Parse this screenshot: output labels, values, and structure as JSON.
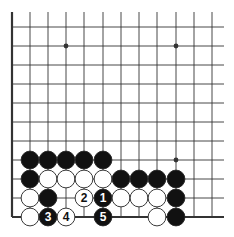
{
  "diagram": {
    "type": "go-board-fragment",
    "grid": {
      "x_lines": [
        12,
        30,
        48,
        66,
        84,
        103,
        121,
        139,
        157,
        176,
        194,
        212
      ],
      "y_lines": [
        27,
        46,
        65,
        84,
        103,
        122,
        141,
        160,
        179,
        198,
        217
      ],
      "right_extent": 224,
      "top_extent": 12,
      "left_edge": true,
      "bottom_edge": true
    },
    "star_points": [
      {
        "col": 3,
        "row": 1
      },
      {
        "col": 9,
        "row": 1
      },
      {
        "col": 9,
        "row": 7
      }
    ],
    "stones": [
      {
        "col": 1,
        "row": 7,
        "color": "black"
      },
      {
        "col": 2,
        "row": 7,
        "color": "black"
      },
      {
        "col": 3,
        "row": 7,
        "color": "black"
      },
      {
        "col": 4,
        "row": 7,
        "color": "black"
      },
      {
        "col": 5,
        "row": 7,
        "color": "black"
      },
      {
        "col": 1,
        "row": 8,
        "color": "black"
      },
      {
        "col": 2,
        "row": 8,
        "color": "white"
      },
      {
        "col": 3,
        "row": 8,
        "color": "white"
      },
      {
        "col": 4,
        "row": 8,
        "color": "white"
      },
      {
        "col": 5,
        "row": 8,
        "color": "white"
      },
      {
        "col": 6,
        "row": 8,
        "color": "black"
      },
      {
        "col": 7,
        "row": 8,
        "color": "black"
      },
      {
        "col": 8,
        "row": 8,
        "color": "black"
      },
      {
        "col": 9,
        "row": 8,
        "color": "black"
      },
      {
        "col": 1,
        "row": 9,
        "color": "white"
      },
      {
        "col": 2,
        "row": 9,
        "color": "black"
      },
      {
        "col": 4,
        "row": 9,
        "color": "white",
        "label": "2"
      },
      {
        "col": 5,
        "row": 9,
        "color": "black",
        "label": "1"
      },
      {
        "col": 6,
        "row": 9,
        "color": "white"
      },
      {
        "col": 7,
        "row": 9,
        "color": "white"
      },
      {
        "col": 8,
        "row": 9,
        "color": "white"
      },
      {
        "col": 9,
        "row": 9,
        "color": "black"
      },
      {
        "col": 1,
        "row": 10,
        "color": "white"
      },
      {
        "col": 2,
        "row": 10,
        "color": "black",
        "label": "3"
      },
      {
        "col": 3,
        "row": 10,
        "color": "white",
        "label": "4"
      },
      {
        "col": 5,
        "row": 10,
        "color": "black",
        "label": "5"
      },
      {
        "col": 8,
        "row": 10,
        "color": "white"
      },
      {
        "col": 9,
        "row": 10,
        "color": "black"
      }
    ],
    "colors": {
      "line": "#333333",
      "black_stone": "#111111",
      "white_stone": "#ffffff",
      "stone_outline": "#222222"
    }
  }
}
